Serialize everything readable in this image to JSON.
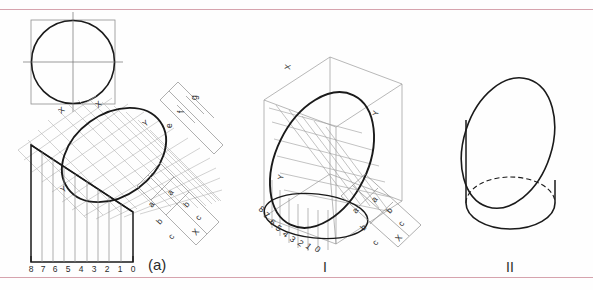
{
  "sheet": {
    "title": "Cylinder truncated by oblique plane - development and projections",
    "rule_color": "#d6a3ad",
    "ink_color": "#1a1a1a",
    "construction_color": "#9a9a9a",
    "background": "#fefefe"
  },
  "figures": [
    {
      "id": "top-view",
      "name": "circle-in-square-top-view",
      "description": "Top view: circle inscribed in square with centrelines"
    },
    {
      "id": "development",
      "label": "(a)",
      "name": "development-view",
      "description": "Development of truncated cylinder with diagonal grid, ellipse and triangular development"
    },
    {
      "id": "isometric",
      "label": "I",
      "name": "isometric-view",
      "description": "Isometric projection of truncated cylinder inside bounding box"
    },
    {
      "id": "pictorial",
      "label": "II",
      "name": "pictorial-view",
      "description": "Pictorial view of truncated cylinder with hidden back edge"
    }
  ],
  "scale_numbers": [
    "8",
    "7",
    "6",
    "5",
    "4",
    "3",
    "2",
    "1",
    "0"
  ],
  "dimension_labels_upper": [
    "g",
    "f",
    "e"
  ],
  "dimension_labels_lower": [
    "a",
    "a",
    "b",
    "b",
    "c",
    "c"
  ],
  "axis_markers": [
    "X",
    "Y"
  ],
  "cross_marker": "X",
  "labels": {
    "fig_a": "(a)",
    "fig_one": "I",
    "fig_two": "II"
  }
}
